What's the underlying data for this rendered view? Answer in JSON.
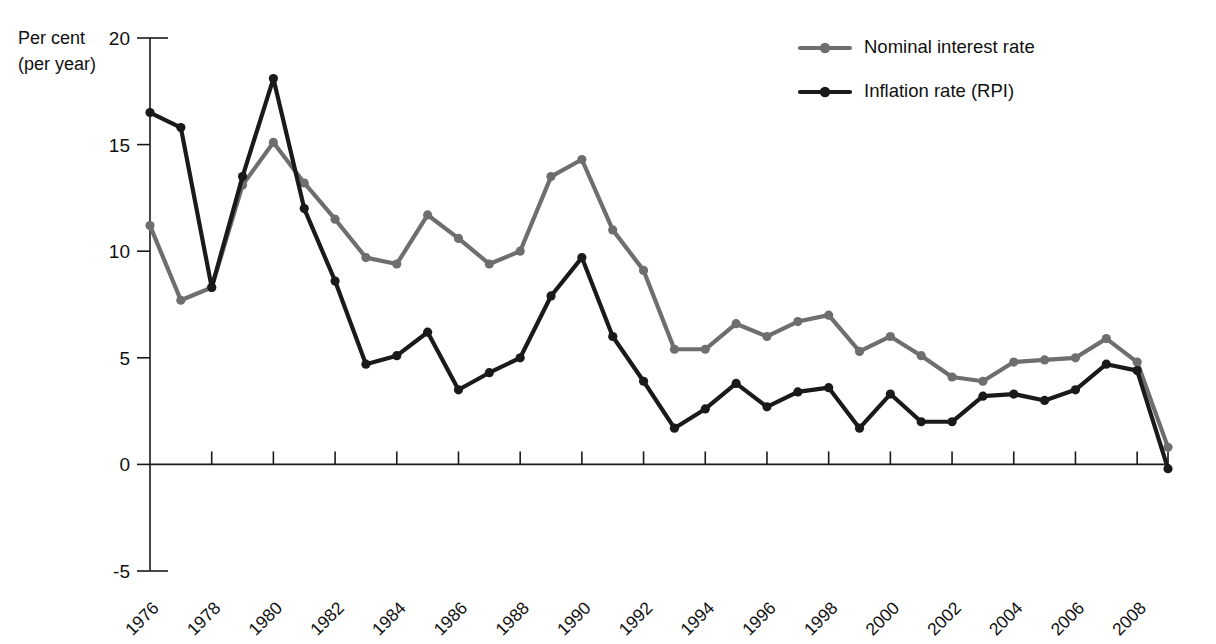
{
  "chart_data": {
    "type": "line",
    "title": "",
    "subtitle": "",
    "xlabel": "",
    "ylabel": "Per cent (per year)",
    "ylabel_line1": "Per cent",
    "ylabel_line2": "(per year)",
    "grid": false,
    "legend_position": "top-right",
    "xlim": [
      1976,
      2009
    ],
    "ylim": [
      -5,
      20
    ],
    "y_ticks": [
      20,
      15,
      10,
      5,
      0,
      -5
    ],
    "y_tick_labels": [
      "20",
      "15",
      "10",
      "5",
      "0",
      "-5"
    ],
    "x_tick_labels": [
      "1976",
      "1978",
      "1980",
      "1982",
      "1984",
      "1986",
      "1988",
      "1990",
      "1992",
      "1994",
      "1996",
      "1998",
      "2000",
      "2002",
      "2004",
      "2006",
      "2008"
    ],
    "x_tick_values": [
      1976,
      1978,
      1980,
      1982,
      1984,
      1986,
      1988,
      1990,
      1992,
      1994,
      1996,
      1998,
      2000,
      2002,
      2004,
      2006,
      2008
    ],
    "x_minor_interval": 1,
    "x": [
      1976,
      1977,
      1978,
      1979,
      1980,
      1981,
      1982,
      1983,
      1984,
      1985,
      1986,
      1987,
      1988,
      1989,
      1990,
      1991,
      1992,
      1993,
      1994,
      1995,
      1996,
      1997,
      1998,
      1999,
      2000,
      2001,
      2002,
      2003,
      2004,
      2005,
      2006,
      2007,
      2008,
      2009
    ],
    "series": [
      {
        "name": "Nominal interest rate",
        "color": "#6e6e6e",
        "values": [
          11.2,
          7.7,
          8.3,
          13.1,
          15.1,
          13.2,
          11.5,
          9.7,
          9.4,
          11.7,
          10.6,
          9.4,
          10.0,
          13.5,
          14.3,
          11.0,
          9.1,
          5.4,
          5.4,
          6.6,
          6.0,
          6.7,
          7.0,
          5.3,
          6.0,
          5.1,
          4.1,
          3.9,
          4.8,
          4.9,
          5.0,
          5.9,
          4.8,
          0.8
        ]
      },
      {
        "name": "Inflation rate (RPI)",
        "color": "#1a1a1a",
        "values": [
          16.5,
          15.8,
          8.3,
          13.5,
          18.1,
          12.0,
          8.6,
          4.7,
          5.1,
          6.2,
          3.5,
          4.3,
          5.0,
          7.9,
          9.7,
          6.0,
          3.9,
          1.7,
          2.6,
          3.8,
          2.7,
          3.4,
          3.6,
          1.7,
          3.3,
          2.0,
          2.0,
          3.2,
          3.3,
          3.0,
          3.5,
          4.7,
          4.4,
          -0.2
        ]
      }
    ],
    "annotations": []
  },
  "legend": {
    "items": [
      {
        "label": "Nominal interest rate",
        "color": "#6e6e6e"
      },
      {
        "label": "Inflation rate (RPI)",
        "color": "#1a1a1a"
      }
    ]
  }
}
